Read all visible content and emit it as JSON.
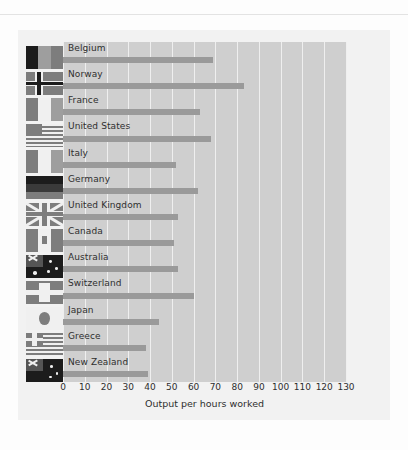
{
  "page": {
    "background": "#fdfdfd",
    "panel_background": "#f2f2f2",
    "plot_background": "#cfcfcf",
    "gridline_color": "#efefef",
    "bar_color": "#9a9a9a",
    "text_color": "#2e2e2e"
  },
  "chart_data": {
    "type": "bar",
    "orientation": "horizontal",
    "title": "",
    "subtitle": "",
    "xlabel": "Output per hours worked",
    "ylabel": "",
    "xlim": [
      0,
      130
    ],
    "xticks": [
      0,
      10,
      20,
      30,
      40,
      50,
      60,
      70,
      80,
      90,
      100,
      110,
      120,
      130
    ],
    "xtick_labels": [
      "0",
      "10",
      "20",
      "30",
      "40",
      "50",
      "60",
      "70",
      "80",
      "90",
      "100",
      "110",
      "120",
      "130"
    ],
    "grid": true,
    "grid_axis": "x",
    "legend": false,
    "categories": [
      "Belgium",
      "Norway",
      "France",
      "United States",
      "Italy",
      "Germany",
      "United Kingdom",
      "Canada",
      "Australia",
      "Switzerland",
      "Japan",
      "Greece",
      "New Zealand"
    ],
    "values": [
      69,
      83,
      63,
      68,
      52,
      62,
      53,
      51,
      53,
      60,
      44,
      38,
      39
    ],
    "series": [
      {
        "name": "Output per hours worked",
        "values": [
          69,
          83,
          63,
          68,
          52,
          62,
          53,
          51,
          53,
          60,
          44,
          38,
          39
        ]
      }
    ],
    "row_icons": [
      "flag-belgium-icon",
      "flag-norway-icon",
      "flag-france-icon",
      "flag-united-states-icon",
      "flag-italy-icon",
      "flag-germany-icon",
      "flag-united-kingdom-icon",
      "flag-canada-icon",
      "flag-australia-icon",
      "flag-switzerland-icon",
      "flag-japan-icon",
      "flag-greece-icon",
      "flag-new-zealand-icon"
    ]
  }
}
